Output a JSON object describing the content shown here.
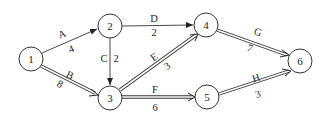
{
  "diagram": {
    "type": "activity-on-arrow network",
    "nodes": [
      {
        "id": "1",
        "label": "1",
        "x": 31,
        "y": 59
      },
      {
        "id": "2",
        "label": "2",
        "x": 110,
        "y": 26
      },
      {
        "id": "3",
        "label": "3",
        "x": 110,
        "y": 98
      },
      {
        "id": "4",
        "label": "4",
        "x": 206,
        "y": 25
      },
      {
        "id": "5",
        "label": "5",
        "x": 207,
        "y": 97
      },
      {
        "id": "6",
        "label": "6",
        "x": 300,
        "y": 61
      }
    ],
    "edges": [
      {
        "from": "1",
        "to": "2",
        "activity": "A",
        "duration": "4",
        "critical": false
      },
      {
        "from": "1",
        "to": "3",
        "activity": "B",
        "duration": "8",
        "critical": true
      },
      {
        "from": "2",
        "to": "3",
        "activity": "C",
        "duration": "2",
        "critical": false
      },
      {
        "from": "2",
        "to": "4",
        "activity": "D",
        "duration": "2",
        "critical": false
      },
      {
        "from": "3",
        "to": "4",
        "activity": "E",
        "duration": "3",
        "critical": true
      },
      {
        "from": "3",
        "to": "5",
        "activity": "F",
        "duration": "6",
        "critical": true
      },
      {
        "from": "4",
        "to": "6",
        "activity": "G",
        "duration": "7",
        "critical": true
      },
      {
        "from": "5",
        "to": "6",
        "activity": "H",
        "duration": "3",
        "critical": true
      }
    ],
    "legend_note": "double lines mark the critical path"
  },
  "labels": {
    "n1": "1",
    "n2": "2",
    "n3": "3",
    "n4": "4",
    "n5": "5",
    "n6": "6",
    "A": "A",
    "A_d": "4",
    "B": "B",
    "B_d": "8",
    "C": "C",
    "C_d": "2",
    "D": "D",
    "D_d": "2",
    "E": "E",
    "E_d": "3",
    "F": "F",
    "F_d": "6",
    "G": "G",
    "G_d": "7",
    "H": "H",
    "H_d": "3"
  }
}
